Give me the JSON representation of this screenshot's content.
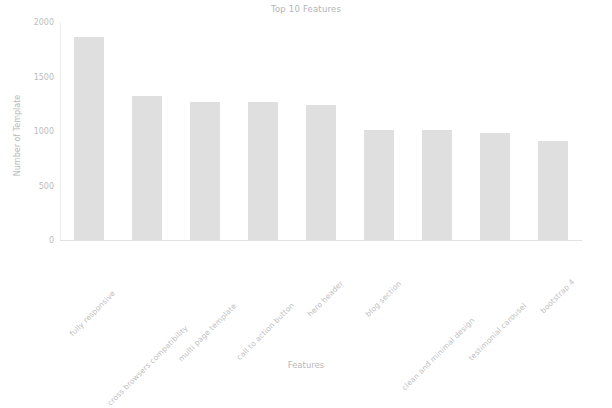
{
  "chart_data": {
    "type": "bar",
    "title": "Top 10 Features",
    "xlabel": "Features",
    "ylabel": "Number of Template",
    "categories": [
      "fully responsive",
      "cross browsers compatibility",
      "multi page template",
      "call to action button",
      "hero header",
      "blog section",
      "clean and minimal design",
      "testimonial carousel",
      "bootstrap 4"
    ],
    "values": [
      1865,
      1325,
      1270,
      1265,
      1240,
      1010,
      1010,
      985,
      910
    ],
    "ylim": [
      0,
      2000
    ],
    "yticks": [
      0,
      500,
      1000,
      1500,
      2000
    ],
    "ytick_labels": [
      "0",
      "500",
      "1000",
      "1500",
      "2000"
    ],
    "grid": false,
    "legend": false,
    "bar_color": "#dcdcdc",
    "text_color": "#bcbcbc",
    "bars": [
      {
        "label": "fully responsive",
        "value": 1865
      },
      {
        "label": "cross browsers compatibility",
        "value": 1325
      },
      {
        "label": "multi page template",
        "value": 1270
      },
      {
        "label": "call to action button",
        "value": 1265
      },
      {
        "label": "hero header",
        "value": 1240
      },
      {
        "label": "blog section",
        "value": 1010
      },
      {
        "label": "clean and minimal design",
        "value": 1010
      },
      {
        "label": "testimonial carousel",
        "value": 985
      },
      {
        "label": "bootstrap 4",
        "value": 910
      }
    ]
  }
}
